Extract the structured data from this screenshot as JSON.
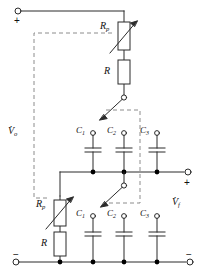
{
  "diagram": {
    "type": "electrical-schematic",
    "colors": {
      "wire": "#2b2b2b",
      "dashed": "#8c8c8c",
      "node": "#000000",
      "background": "#ffffff",
      "text": "#111111"
    }
  },
  "terminals": {
    "input_top": {
      "polarity": "+",
      "label": "+"
    },
    "input_bottom": {
      "polarity": "−",
      "label": "−"
    },
    "output_top": {
      "polarity": "+",
      "label": "+"
    },
    "output_bottom": {
      "polarity": "−",
      "label": "−"
    }
  },
  "voltages": {
    "input": {
      "symbol": "V",
      "subscript": "o",
      "dot": true
    },
    "output": {
      "symbol": "V",
      "subscript": "f",
      "dot": true
    }
  },
  "components": {
    "upper_branch": {
      "potentiometer": {
        "label": "R",
        "subscript": "p",
        "variable": true
      },
      "resistor": {
        "label": "R",
        "subscript": "",
        "variable": false
      },
      "switch": {
        "label": "",
        "state": "open",
        "type": "rotary-selector"
      }
    },
    "lower_branch": {
      "potentiometer": {
        "label": "R",
        "subscript": "p",
        "variable": true
      },
      "resistor": {
        "label": "R",
        "subscript": "",
        "variable": false
      },
      "switch": {
        "label": "",
        "state": "open",
        "type": "rotary-selector"
      }
    },
    "capacitors_upper": [
      {
        "label": "C",
        "subscript": "1"
      },
      {
        "label": "C",
        "subscript": "2"
      },
      {
        "label": "C",
        "subscript": "3"
      }
    ],
    "capacitors_lower": [
      {
        "label": "C",
        "subscript": "1"
      },
      {
        "label": "C",
        "subscript": "2"
      },
      {
        "label": "C",
        "subscript": "3"
      }
    ]
  },
  "annotations": {
    "ganging_note": "dashed lines indicate ganged adjustment"
  }
}
